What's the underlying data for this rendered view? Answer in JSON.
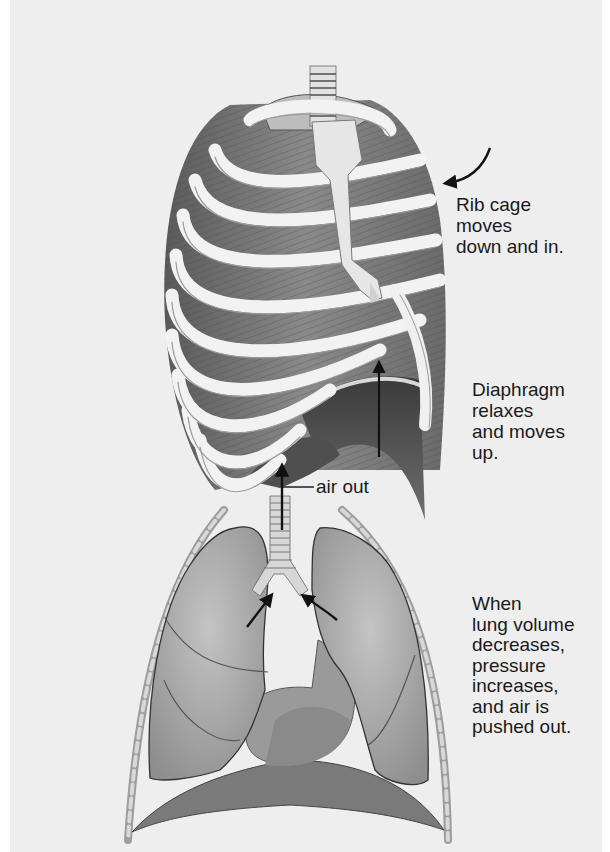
{
  "figure": {
    "topic": "Exhalation (expiration) mechanics",
    "background_color": "#eeeeee",
    "illustration_tone": "grayscale"
  },
  "labels": {
    "rib_cage": "Rib cage\nmoves\ndown and in.",
    "diaphragm": "Diaphragm\nrelaxes\nand moves\nup.",
    "air_out": "air out",
    "lung_volume": "When\nlung volume\ndecreases,\npressure\nincreases,\nand air is\npushed out."
  },
  "illustrations": [
    {
      "name": "rib-cage",
      "description": "Rib cage with sternum, trachea, intercostal muscles, and relaxed domed diaphragm"
    },
    {
      "name": "lungs",
      "description": "Frontal view of lungs, trachea, bronchi, heart silhouette, diaphragm, and chest wall ribs"
    }
  ],
  "arrows": [
    {
      "name": "rib-cage-motion-arrow",
      "direction": "curved down-left"
    },
    {
      "name": "diaphragm-up-arrow",
      "direction": "up"
    },
    {
      "name": "air-out-arrow",
      "direction": "up"
    },
    {
      "name": "bronchus-left-arrow",
      "direction": "up-right"
    },
    {
      "name": "bronchus-right-arrow",
      "direction": "up-left"
    }
  ]
}
